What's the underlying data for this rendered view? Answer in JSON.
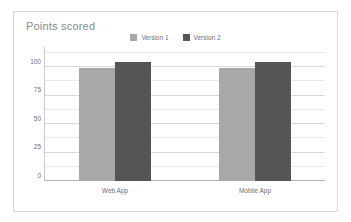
{
  "chart_data": {
    "type": "bar",
    "title": "Points scored",
    "xlabel": "",
    "ylabel": "",
    "categories": [
      "Web App",
      "Mobile App"
    ],
    "series": [
      {
        "name": "Version 1",
        "color": "#a8a8a8",
        "values": [
          99,
          99
        ]
      },
      {
        "name": "Version 2",
        "color": "#555555",
        "values": [
          105,
          105
        ]
      }
    ],
    "ylim": [
      0,
      112.5
    ],
    "yticks": [
      0,
      25,
      50,
      75,
      100
    ],
    "ytick_labels": [
      "0",
      "25",
      "50",
      "75",
      "100"
    ],
    "minor_gridline_step": 12.5,
    "grid": true,
    "legend_position": "top-center"
  },
  "frame": {
    "border_color": "#d8d8d8",
    "background": "#ffffff"
  }
}
